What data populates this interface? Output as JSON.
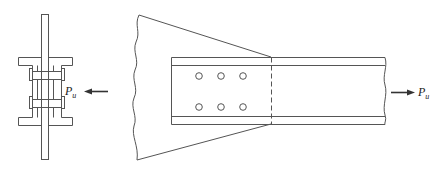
{
  "diagram": {
    "title": "",
    "colors": {
      "stroke": "#555555",
      "arrow": "#333333",
      "background": "#ffffff"
    },
    "section_view": {
      "name": "end-section",
      "components": [
        "gusset-plate",
        "two-channels",
        "two-bolts"
      ]
    },
    "elevation_view": {
      "name": "elevation",
      "bolt_holes": {
        "rows": 2,
        "columns": 3,
        "count": 6
      },
      "components": [
        "gusset-plate",
        "channel",
        "bolt-holes",
        "dashed-plate-edge"
      ]
    },
    "loads": {
      "left": {
        "symbol": "P",
        "subscript": "u",
        "direction": "left"
      },
      "right": {
        "symbol": "P",
        "subscript": "u",
        "direction": "right"
      }
    }
  }
}
